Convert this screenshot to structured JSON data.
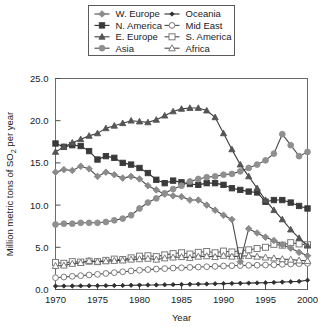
{
  "chart_data": {
    "type": "line",
    "title": "",
    "xlabel": "Year",
    "ylabel": "Million metric tons of SO2 per year",
    "ylabel_display": "Million metric tons of SO",
    "ylabel_sub": "2",
    "ylabel_tail": " per year",
    "xlim": [
      1970,
      2000
    ],
    "ylim": [
      0.0,
      25.0
    ],
    "grid": false,
    "legend_position": "top",
    "xticks": [
      1970,
      1975,
      1980,
      1985,
      1990,
      1995,
      2000
    ],
    "xtick_labels": [
      "1970",
      "1975",
      "1980",
      "1985",
      "1990",
      "1995",
      "2000"
    ],
    "yticks": [
      0.0,
      5.0,
      10.0,
      15.0,
      20.0,
      25.0
    ],
    "ytick_labels": [
      "0.0",
      "5.0",
      "10.0",
      "15.0",
      "20.0",
      "25.0"
    ],
    "x": [
      1970,
      1971,
      1972,
      1973,
      1974,
      1975,
      1976,
      1977,
      1978,
      1979,
      1980,
      1981,
      1982,
      1983,
      1984,
      1985,
      1986,
      1987,
      1988,
      1989,
      1990,
      1991,
      1992,
      1993,
      1994,
      1995,
      1996,
      1997,
      1998,
      1999,
      2000
    ],
    "series": [
      {
        "name": "W. Europe",
        "marker": "diamond",
        "color": "#8a8a8a",
        "line_color": "#4a4a4a",
        "filled": true,
        "values": [
          13.9,
          14.2,
          14.1,
          14.6,
          14.3,
          13.4,
          13.9,
          13.6,
          13.2,
          13.4,
          13.1,
          12.3,
          11.8,
          11.3,
          11.1,
          11.0,
          10.6,
          10.6,
          10.0,
          9.4,
          8.8,
          8.3,
          3.3,
          7.2,
          6.7,
          6.2,
          5.8,
          5.3,
          4.9,
          4.4,
          4.0
        ]
      },
      {
        "name": "N. America",
        "marker": "square",
        "color": "#3a3a3a",
        "line_color": "#2e2e2e",
        "filled": true,
        "values": [
          17.3,
          16.9,
          17.1,
          17.0,
          16.4,
          15.4,
          15.8,
          15.6,
          15.0,
          14.8,
          14.4,
          13.8,
          13.0,
          12.6,
          12.9,
          12.7,
          12.5,
          12.4,
          12.6,
          12.6,
          12.4,
          12.0,
          11.8,
          11.6,
          11.5,
          10.4,
          10.6,
          10.6,
          10.3,
          9.9,
          9.6
        ]
      },
      {
        "name": "E. Europe",
        "marker": "triangle",
        "color": "#555555",
        "line_color": "#3c3c3c",
        "filled": true,
        "values": [
          16.3,
          16.9,
          17.4,
          17.8,
          18.2,
          18.5,
          19.1,
          19.4,
          19.7,
          20.0,
          19.9,
          19.8,
          20.1,
          20.6,
          21.1,
          21.4,
          21.5,
          21.5,
          21.2,
          20.4,
          18.5,
          16.6,
          14.8,
          13.4,
          12.0,
          10.6,
          9.4,
          8.3,
          7.1,
          6.1,
          5.2
        ]
      },
      {
        "name": "Asia",
        "marker": "circle",
        "color": "#8f8f8f",
        "line_color": "#4a4a4a",
        "filled": true,
        "values": [
          7.7,
          7.8,
          7.8,
          7.9,
          7.9,
          7.9,
          8.0,
          8.2,
          8.4,
          8.8,
          9.6,
          10.3,
          10.8,
          11.4,
          11.9,
          12.3,
          12.8,
          13.1,
          13.3,
          13.4,
          13.6,
          13.7,
          14.0,
          14.4,
          14.8,
          15.3,
          16.1,
          18.4,
          17.1,
          15.8,
          16.3
        ]
      },
      {
        "name": "Oceania",
        "marker": "small-diamond",
        "color": "#2e2e2e",
        "line_color": "#2e2e2e",
        "filled": true,
        "values": [
          0.4,
          0.41,
          0.42,
          0.43,
          0.44,
          0.45,
          0.46,
          0.47,
          0.48,
          0.5,
          0.52,
          0.53,
          0.54,
          0.56,
          0.58,
          0.6,
          0.62,
          0.64,
          0.66,
          0.68,
          0.7,
          0.72,
          0.74,
          0.76,
          0.78,
          0.8,
          0.84,
          0.88,
          0.92,
          0.96,
          1.1
        ]
      },
      {
        "name": "Mid East",
        "marker": "open-circle",
        "color": "#7a7a7a",
        "line_color": "#4a4a4a",
        "filled": false,
        "values": [
          1.4,
          1.48,
          1.56,
          1.64,
          1.72,
          1.8,
          1.9,
          2.0,
          2.1,
          2.2,
          2.28,
          2.36,
          2.42,
          2.48,
          2.54,
          2.58,
          2.62,
          2.66,
          2.7,
          2.74,
          2.78,
          2.82,
          2.84,
          2.86,
          2.88,
          2.9,
          2.94,
          2.98,
          3.02,
          3.06,
          3.1
        ]
      },
      {
        "name": "S. America",
        "marker": "open-square",
        "color": "#7a7a7a",
        "line_color": "#4a4a4a",
        "filled": false,
        "values": [
          3.2,
          3.1,
          3.3,
          3.25,
          3.35,
          3.3,
          3.45,
          3.6,
          3.55,
          3.75,
          3.95,
          4.0,
          3.9,
          4.1,
          4.25,
          4.35,
          4.2,
          4.4,
          4.5,
          4.35,
          4.55,
          4.45,
          4.6,
          4.7,
          4.85,
          5.0,
          5.35,
          5.25,
          5.55,
          5.4,
          5.3
        ]
      },
      {
        "name": "Africa",
        "marker": "open-triangle",
        "color": "#7a7a7a",
        "line_color": "#4a4a4a",
        "filled": false,
        "values": [
          2.8,
          2.85,
          3.05,
          3.15,
          3.4,
          3.3,
          3.35,
          3.4,
          3.45,
          3.55,
          3.6,
          3.65,
          3.55,
          3.7,
          3.8,
          3.85,
          3.75,
          3.9,
          3.95,
          3.85,
          4.0,
          3.9,
          3.95,
          4.0,
          3.9,
          3.8,
          3.7,
          3.6,
          3.55,
          3.45,
          3.4
        ]
      }
    ],
    "legend_entries": [
      {
        "name": "W. Europe",
        "column": 0,
        "row": 0
      },
      {
        "name": "N. America",
        "column": 0,
        "row": 1
      },
      {
        "name": "E. Europe",
        "column": 0,
        "row": 2
      },
      {
        "name": "Asia",
        "column": 0,
        "row": 3
      },
      {
        "name": "Oceania",
        "column": 1,
        "row": 0
      },
      {
        "name": "Mid East",
        "column": 1,
        "row": 1
      },
      {
        "name": "S. America",
        "column": 1,
        "row": 2
      },
      {
        "name": "Africa",
        "column": 1,
        "row": 3
      }
    ]
  }
}
